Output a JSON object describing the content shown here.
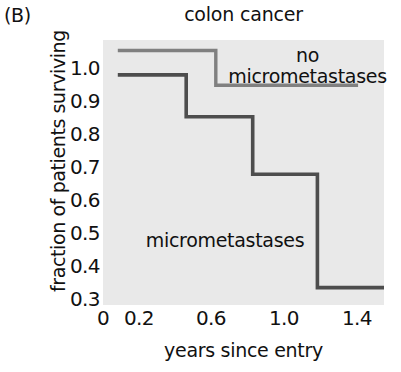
{
  "panel": {
    "label": "(B)"
  },
  "chart_data": {
    "type": "line",
    "subtype": "kaplan-meier-step",
    "title": "colon cancer",
    "xlabel": "years since entry",
    "ylabel": "fraction of patients surviving",
    "xlim": [
      0,
      1.52
    ],
    "ylim": [
      0.27,
      1.03
    ],
    "xticks": [
      "0",
      "0.2",
      "0.6",
      "1.0",
      "1.4"
    ],
    "xtick_values": [
      0,
      0.2,
      0.6,
      1.0,
      1.4
    ],
    "yticks": [
      "1.0",
      "0.9",
      "0.8",
      "0.7",
      "0.6",
      "0.5",
      "0.4",
      "0.3"
    ],
    "ytick_values": [
      1.0,
      0.9,
      0.8,
      0.7,
      0.6,
      0.5,
      0.4,
      0.3
    ],
    "grid": false,
    "legend_position": "in-plot annotations",
    "plot_background": "#e9e9e9",
    "series": [
      {
        "name": "no micrometastases",
        "color": "#808080",
        "label_lines": [
          "no",
          "micrometastases"
        ],
        "steps": [
          {
            "x_start": 0.08,
            "x_end": 0.61,
            "y": 1.0
          },
          {
            "x_start": 0.61,
            "x_end": 1.38,
            "y": 0.9
          }
        ]
      },
      {
        "name": "micrometastases",
        "color": "#4d4d4d",
        "label_lines": [
          "micrometastases"
        ],
        "steps": [
          {
            "x_start": 0.08,
            "x_end": 0.45,
            "y": 0.93
          },
          {
            "x_start": 0.45,
            "x_end": 0.81,
            "y": 0.81
          },
          {
            "x_start": 0.81,
            "x_end": 1.16,
            "y": 0.645
          },
          {
            "x_start": 1.16,
            "x_end": 1.52,
            "y": 0.32
          }
        ]
      }
    ]
  }
}
